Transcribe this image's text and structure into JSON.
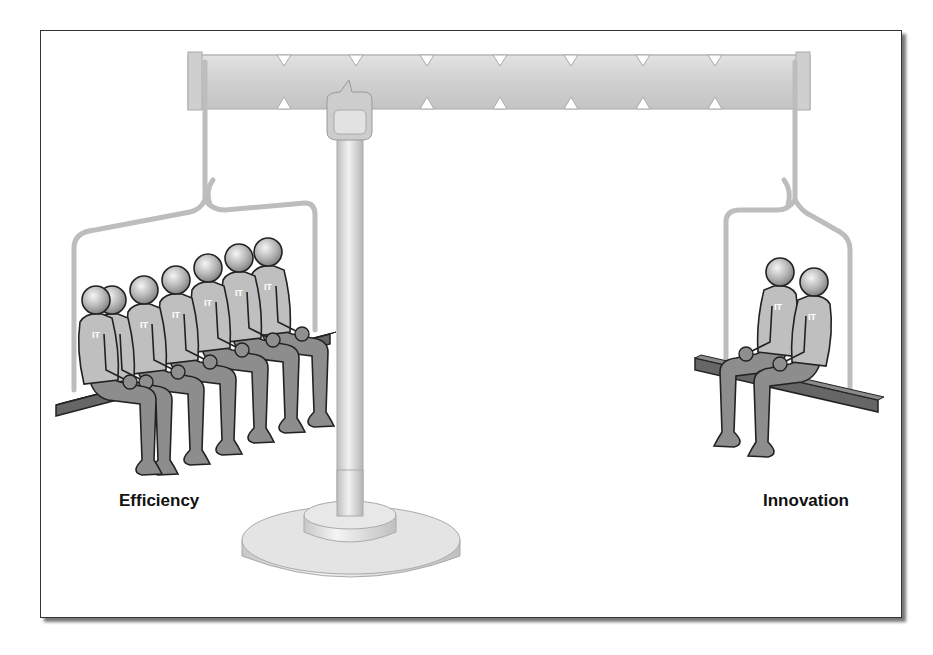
{
  "diagram": {
    "type": "balance-scale-illustration",
    "left_side": {
      "label": "Efficiency",
      "people_count": 6,
      "shirt_text": "IT"
    },
    "right_side": {
      "label": "Innovation",
      "people_count": 2,
      "shirt_text": "IT"
    },
    "colors": {
      "frame": "#333333",
      "metal": "#d4d4d4",
      "bench": "#555555",
      "figure_body": "#bdbdbd",
      "figure_legs": "#8a8a8a",
      "outline": "#222222",
      "text": "#111111"
    }
  }
}
